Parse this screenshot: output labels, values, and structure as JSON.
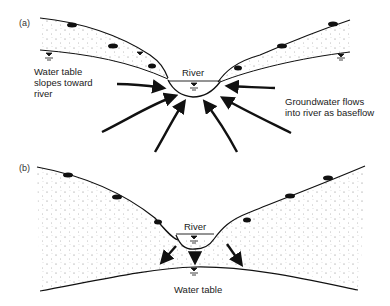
{
  "figure": {
    "panels": [
      {
        "id": "a",
        "label": "(a)",
        "river_label": "River",
        "left_annotation": "Water table\nslopes toward\nriver",
        "right_annotation": "Groundwater flows\ninto river as baseflow"
      },
      {
        "id": "b",
        "label": "(b)",
        "river_label": "River",
        "bottom_annotation": "Water table"
      }
    ],
    "colors": {
      "line": "#111111",
      "stipple": "#555555",
      "background": "#ffffff"
    }
  }
}
